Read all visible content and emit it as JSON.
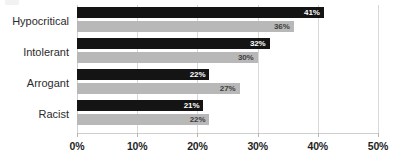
{
  "chart_data": {
    "type": "bar",
    "orientation": "horizontal",
    "title": "",
    "subtitle": "",
    "xlabel": "",
    "ylabel": "",
    "categories": [
      "Hypocritical",
      "Intolerant",
      "Arrogant",
      "Racist"
    ],
    "series": [
      {
        "name": "series-dark",
        "color": "#141414",
        "values": [
          41,
          32,
          22,
          21
        ],
        "value_labels": [
          "41%",
          "32%",
          "22%",
          "21%"
        ]
      },
      {
        "name": "series-light",
        "color": "#b8b8b8",
        "values": [
          36,
          30,
          27,
          22
        ],
        "value_labels": [
          "36%",
          "30%",
          "27%",
          "22%"
        ]
      }
    ],
    "xlim": [
      0,
      50
    ],
    "xticks": [
      0,
      10,
      20,
      30,
      40,
      50
    ],
    "xtick_labels": [
      "0%",
      "10%",
      "20%",
      "30%",
      "40%",
      "50%"
    ],
    "grid": true,
    "grid_axis": "x",
    "legend": false,
    "legend_position": "none",
    "value_label_suffix": "%"
  },
  "style": {
    "background": "#ffffff",
    "gridline_color": "#d9d9d9",
    "axis_color": "#cfcfcf",
    "category_label_color": "#2b2b2b",
    "tick_label_color": "#1f1f1f",
    "dark_label_color": "#ffffff",
    "light_label_color": "#3d3d3d"
  }
}
